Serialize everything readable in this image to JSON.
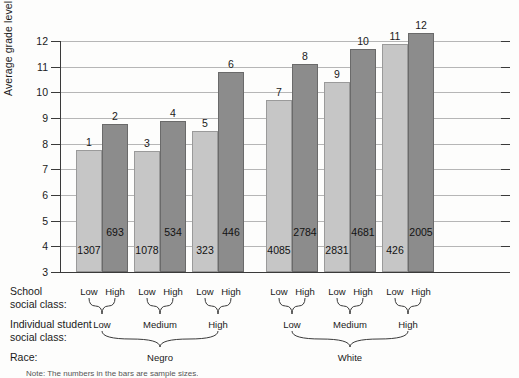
{
  "chart_data": {
    "type": "bar",
    "title": "",
    "xlabel": "",
    "ylabel": "Average grade level",
    "ylim": [
      3,
      12
    ],
    "yticks": [
      3,
      4,
      5,
      6,
      7,
      8,
      9,
      10,
      11,
      12
    ],
    "grid": true,
    "legend": "none",
    "categories": [
      "Negro / Low / Low",
      "Negro / Low / High",
      "Negro / Medium / Low",
      "Negro / Medium / High",
      "Negro / High / Low",
      "Negro / High / High",
      "White / Low / Low",
      "White / Low / High",
      "White / Medium / Low",
      "White / Medium / High",
      "White / High / Low",
      "White / High / High"
    ],
    "bars": [
      {
        "index": "1",
        "value": 7.75,
        "n": "1307",
        "shade": "light"
      },
      {
        "index": "2",
        "value": 8.75,
        "n": "693",
        "shade": "dark"
      },
      {
        "index": "3",
        "value": 7.7,
        "n": "1078",
        "shade": "light"
      },
      {
        "index": "4",
        "value": 8.9,
        "n": "534",
        "shade": "dark"
      },
      {
        "index": "5",
        "value": 8.5,
        "n": "323",
        "shade": "light"
      },
      {
        "index": "6",
        "value": 10.8,
        "n": "446",
        "shade": "dark"
      },
      {
        "index": "7",
        "value": 9.7,
        "n": "4085",
        "shade": "light"
      },
      {
        "index": "8",
        "value": 11.1,
        "n": "2784",
        "shade": "dark"
      },
      {
        "index": "9",
        "value": 10.4,
        "n": "2831",
        "shade": "light"
      },
      {
        "index": "10",
        "value": 11.7,
        "n": "4681",
        "shade": "dark"
      },
      {
        "index": "11",
        "value": 11.9,
        "n": "426",
        "shade": "light"
      },
      {
        "index": "12",
        "value": 12.3,
        "n": "2005",
        "shade": "dark"
      }
    ],
    "colors": {
      "light_bar": "#c6c6c6",
      "dark_bar": "#8c8c8c",
      "gridline": "#b6b6b6",
      "axis": "#3a3a3a",
      "background": "#fdfdfc"
    }
  },
  "axis": {
    "y_title": "Average grade level",
    "ticks": [
      "12",
      "11",
      "10",
      "9",
      "8",
      "7",
      "6",
      "5",
      "4",
      "3"
    ]
  },
  "bar_numbers": [
    "1",
    "2",
    "3",
    "4",
    "5",
    "6",
    "7",
    "8",
    "9",
    "10",
    "11",
    "12"
  ],
  "bar_counts": [
    "1307",
    "693",
    "1078",
    "534",
    "323",
    "446",
    "4085",
    "2784",
    "2831",
    "4681",
    "426",
    "2005"
  ],
  "category_rows": {
    "school_social_class": {
      "label": "School\nsocial class:",
      "values": [
        "Low",
        "High",
        "Low",
        "High",
        "Low",
        "High",
        "Low",
        "High",
        "Low",
        "High",
        "Low",
        "High"
      ]
    },
    "individual_student_social_class": {
      "label": "Individual student\nsocial class:",
      "values": [
        "Low",
        "Medium",
        "High",
        "Low",
        "Medium",
        "High"
      ]
    },
    "race": {
      "label": "Race:",
      "values": [
        "Negro",
        "White"
      ]
    }
  },
  "footnote": {
    "text": "Note: The numbers in the bars are sample sizes."
  }
}
